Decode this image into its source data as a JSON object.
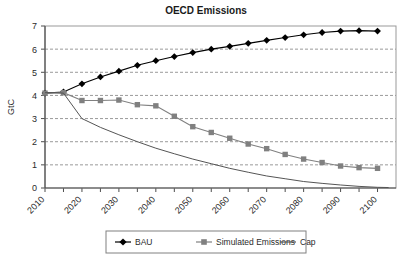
{
  "chart_data": {
    "type": "line",
    "title": "OECD Emissions",
    "xlabel": "",
    "ylabel": "GtC",
    "ylim": [
      0,
      7
    ],
    "xlim": [
      2010,
      2105
    ],
    "yticks": [
      0,
      1,
      2,
      3,
      4,
      5,
      6,
      7
    ],
    "xticks": [
      2010,
      2020,
      2030,
      2040,
      2050,
      2060,
      2070,
      2080,
      2090,
      2100
    ],
    "xtick_labels": [
      "2010",
      "2020",
      "2030",
      "2040",
      "2050",
      "2060",
      "2070",
      "2080",
      "2090",
      "2100"
    ],
    "ytick_labels": [
      "0",
      "1",
      "2",
      "3",
      "4",
      "5",
      "6",
      "7"
    ],
    "grid": "horizontal-dashed",
    "legend_position": "bottom",
    "series": [
      {
        "name": "BAU",
        "marker": "diamond",
        "color": "#000000",
        "x": [
          2010,
          2015,
          2020,
          2025,
          2030,
          2035,
          2040,
          2045,
          2050,
          2055,
          2060,
          2065,
          2070,
          2075,
          2080,
          2085,
          2090,
          2095,
          2100
        ],
        "values": [
          4.1,
          4.15,
          4.5,
          4.8,
          5.05,
          5.3,
          5.5,
          5.68,
          5.85,
          6.0,
          6.12,
          6.25,
          6.38,
          6.5,
          6.62,
          6.72,
          6.78,
          6.8,
          6.78
        ]
      },
      {
        "name": "Simulated Emissions",
        "marker": "square",
        "color": "#808080",
        "x": [
          2010,
          2015,
          2020,
          2025,
          2030,
          2035,
          2040,
          2045,
          2050,
          2055,
          2060,
          2065,
          2070,
          2075,
          2080,
          2085,
          2090,
          2095,
          2100
        ],
        "values": [
          4.1,
          4.12,
          3.78,
          3.78,
          3.8,
          3.6,
          3.55,
          3.1,
          2.65,
          2.4,
          2.15,
          1.9,
          1.7,
          1.45,
          1.25,
          1.1,
          0.95,
          0.88,
          0.85
        ]
      },
      {
        "name": "Cap",
        "marker": "none",
        "color": "#555555",
        "x": [
          2010,
          2012,
          2015,
          2020,
          2025,
          2030,
          2035,
          2040,
          2045,
          2050,
          2055,
          2060,
          2065,
          2070,
          2075,
          2080,
          2085,
          2090,
          2095,
          2100,
          2103
        ],
        "values": [
          4.12,
          4.12,
          4.1,
          3.0,
          2.62,
          2.3,
          2.0,
          1.72,
          1.48,
          1.25,
          1.05,
          0.85,
          0.68,
          0.52,
          0.4,
          0.28,
          0.2,
          0.13,
          0.07,
          0.03,
          0.02
        ]
      }
    ]
  },
  "legend": {
    "items": [
      {
        "label": "BAU"
      },
      {
        "label": "Simulated Emissions"
      },
      {
        "label": "Cap"
      }
    ]
  }
}
